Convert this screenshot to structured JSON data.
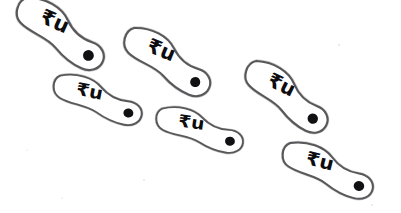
{
  "image": {
    "title": "Hand-drawn paddle shapes with rupee-u glyphs",
    "background_color": "#ffffff",
    "width": 401,
    "height": 213,
    "outline_color": "#59575a",
    "glyph_color": "#0d0c0f",
    "dot_color": "#111013",
    "shape_count": 6
  },
  "glyph": {
    "label": "₹u",
    "primary_char": "₹",
    "secondary_char": "u",
    "description": "rupee-like glyph followed by lowercase u"
  },
  "shapes": [
    {
      "id": "shape-1",
      "name": "paddle-top-left",
      "glyph": "₹u",
      "center_x": 62,
      "center_y": 38,
      "rotation_deg": 24,
      "length": 96,
      "head_radius": 25,
      "tail_radius": 17,
      "dot_x": 93,
      "dot_y": 52,
      "dot_radius": 5.2
    },
    {
      "id": "shape-2",
      "name": "paddle-top-middle",
      "glyph": "₹u",
      "center_x": 169,
      "center_y": 66,
      "rotation_deg": 22,
      "length": 93,
      "head_radius": 24,
      "tail_radius": 16,
      "dot_x": 199,
      "dot_y": 79,
      "dot_radius": 5.0
    },
    {
      "id": "shape-3",
      "name": "paddle-left-middle",
      "glyph": "₹u",
      "center_x": 100,
      "center_y": 103,
      "rotation_deg": 11,
      "length": 90,
      "head_radius": 21,
      "tail_radius": 15,
      "dot_x": 130,
      "dot_y": 110,
      "dot_radius": 4.8
    },
    {
      "id": "shape-4",
      "name": "paddle-bottom-middle",
      "glyph": "₹u",
      "center_x": 202,
      "center_y": 133,
      "rotation_deg": 8,
      "length": 86,
      "head_radius": 20,
      "tail_radius": 14,
      "dot_x": 231,
      "dot_y": 138,
      "dot_radius": 4.6
    },
    {
      "id": "shape-5",
      "name": "paddle-right-middle",
      "glyph": "₹u",
      "center_x": 288,
      "center_y": 101,
      "rotation_deg": 26,
      "length": 92,
      "head_radius": 24,
      "tail_radius": 16,
      "dot_x": 318,
      "dot_y": 116,
      "dot_radius": 5.2
    },
    {
      "id": "shape-6",
      "name": "paddle-bottom-right",
      "glyph": "₹u",
      "center_x": 330,
      "center_y": 174,
      "rotation_deg": 14,
      "length": 92,
      "head_radius": 22,
      "tail_radius": 16,
      "dot_x": 361,
      "dot_y": 183,
      "dot_radius": 5.2
    }
  ]
}
